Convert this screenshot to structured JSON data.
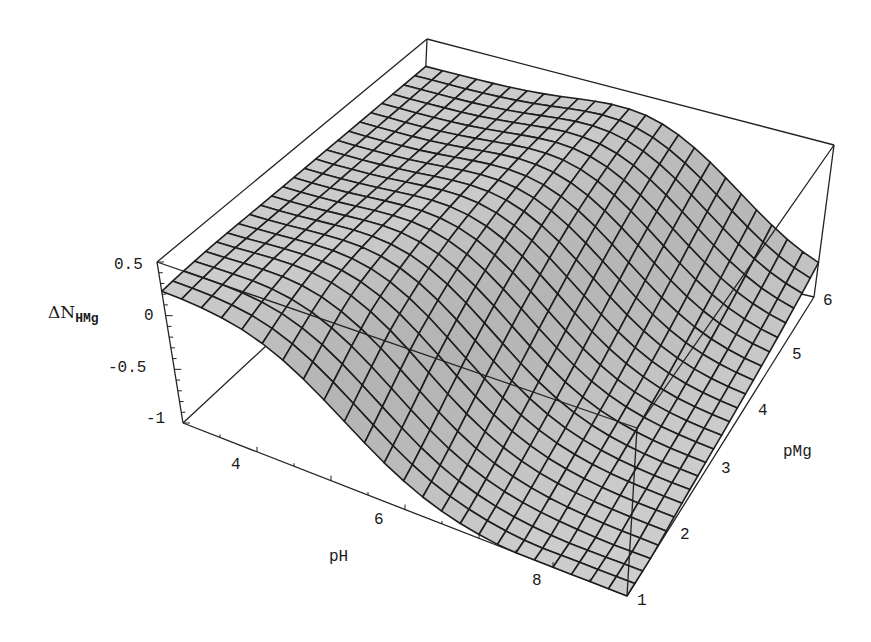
{
  "chart_data": {
    "type": "surface3d",
    "title": "",
    "x_axis": {
      "label": "pH",
      "range": [
        3,
        9
      ],
      "ticks": [
        4,
        6,
        8
      ],
      "tick_labels": [
        "4",
        "6",
        "8"
      ]
    },
    "y_axis": {
      "label": "pMg",
      "range": [
        1,
        6
      ],
      "ticks": [
        1,
        2,
        3,
        4,
        5,
        6
      ],
      "tick_labels": [
        "1",
        "2",
        "3",
        "4",
        "5",
        "6"
      ]
    },
    "z_axis": {
      "label": "ΔN",
      "label_subscript": "HMg",
      "range": [
        -1,
        0.5
      ],
      "ticks": [
        -1,
        -0.5,
        0,
        0.5
      ],
      "tick_labels": [
        "-1",
        "-0.5",
        "0",
        "0.5"
      ]
    },
    "grid": {
      "mesh_lines_x": 24,
      "mesh_lines_y": 24
    },
    "sample_values": [
      {
        "pH": 3,
        "pMg": 1,
        "z": 0.25
      },
      {
        "pH": 3,
        "pMg": 6,
        "z": 0.2
      },
      {
        "pH": 6,
        "pMg": 1,
        "z": -0.3
      },
      {
        "pH": 6,
        "pMg": 4,
        "z": 0.1
      },
      {
        "pH": 9,
        "pMg": 1,
        "z": -1.0
      },
      {
        "pH": 9,
        "pMg": 6,
        "z": -0.85
      }
    ],
    "surface_color": "#c8c8c8",
    "mesh_color": "#1e1e1e",
    "box": true
  },
  "labels": {
    "z_label_main": "ΔN",
    "z_label_sub": "HMg",
    "x_label": "pH",
    "y_label": "pMg"
  }
}
